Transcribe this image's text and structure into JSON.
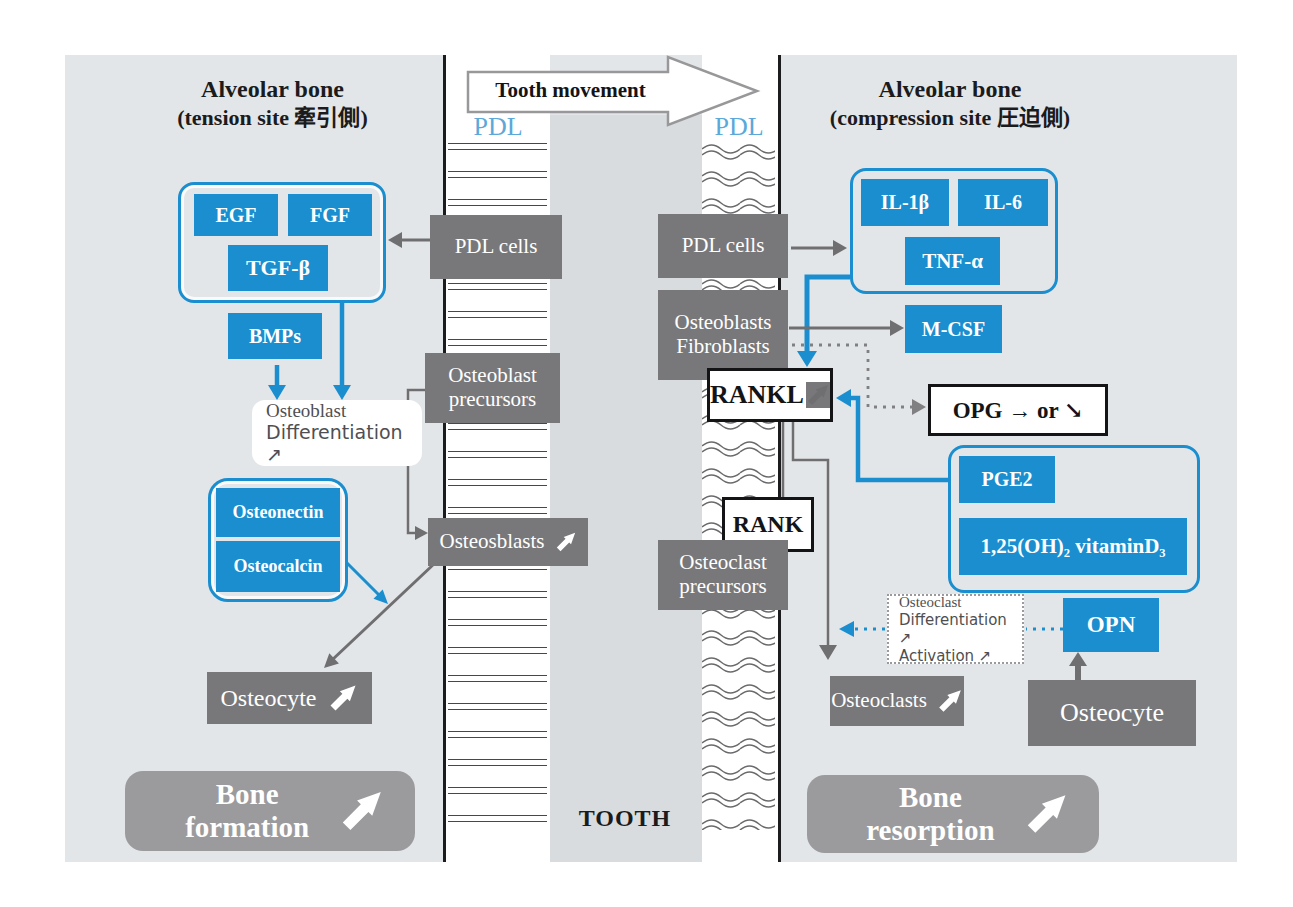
{
  "top": {
    "tooth_movement": "Tooth movement",
    "pdl_left": "PDL",
    "pdl_right": "PDL",
    "tooth_label": "TOOTH"
  },
  "left_side": {
    "title_line1": "Alveolar bone",
    "title_line2": "(tension site 牽引側)",
    "egf": "EGF",
    "fgf": "FGF",
    "tgf_beta": "TGF-β",
    "bmps": "BMPs",
    "pdl_cells": "PDL cells",
    "osteoblast_precursors": "Osteoblast precursors",
    "osteoblast_differentiation_line1": "Osteoblast",
    "osteoblast_differentiation_line2": "Differentiation ↗",
    "osteonectin": "Osteonectin",
    "osteocalcin": "Osteocalcin",
    "osteosblasts": "Osteosblasts",
    "osteocyte": "Osteocyte",
    "bone_formation": "Bone formation"
  },
  "right_side": {
    "title_line1": "Alveolar bone",
    "title_line2": "(compression site 圧迫側)",
    "il1b": "IL-1β",
    "il6": "IL-6",
    "tnfa": "TNF-α",
    "pdl_cells": "PDL cells",
    "osteoblasts_fibroblasts_line1": "Osteoblasts",
    "osteoblasts_fibroblasts_line2": "Fibroblasts",
    "mcsf": "M-CSF",
    "rankl": "RANKL",
    "opg": "OPG → or ↘",
    "pge2": "PGE2",
    "vitamin_d": "1,25(OH)₂ vitaminD₃",
    "rank": "RANK",
    "osteoclast_precursors": "Osteoclast precursors",
    "ocl_diff_line1": "Osteoclast",
    "ocl_diff_line2": "Differentiation ↗",
    "ocl_diff_line3": "Activation ↗",
    "opn": "OPN",
    "osteoclasts": "Osteoclasts",
    "osteocyte": "Osteocyte",
    "bone_resorption": "Bone resorption"
  },
  "icons": {
    "ne_arrow": "↗",
    "right_arrow": "→",
    "down_right_arrow": "↘"
  },
  "colors": {
    "blue": "#1a8ecf",
    "dark_gray_box": "#78787b",
    "light_gray_box": "#9b9b9e",
    "diagram_bg": "#e3e6e8",
    "tooth_bg": "#d9dcde",
    "pdl_label_blue": "#5ba8d9"
  }
}
